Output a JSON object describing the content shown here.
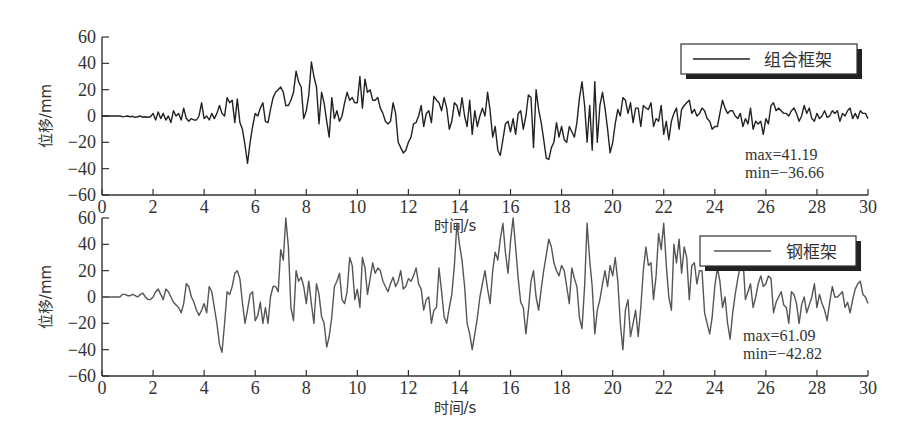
{
  "chart_data": [
    {
      "type": "line",
      "title": "",
      "legend": [
        "组合框架"
      ],
      "xlabel": "时间/s",
      "ylabel": "位移/mm",
      "xlim": [
        0,
        30
      ],
      "ylim": [
        -60,
        60
      ],
      "xticks": [
        0,
        2,
        4,
        6,
        8,
        10,
        12,
        14,
        16,
        18,
        20,
        22,
        24,
        26,
        28,
        30
      ],
      "yticks": [
        60,
        40,
        20,
        0,
        -20,
        -40,
        -60
      ],
      "grid": false,
      "legend_position": "upper right",
      "annotations": [
        "max=41.19",
        "min=−36.66"
      ],
      "line_color": "#222222",
      "series": [
        {
          "name": "组合框架",
          "x_step": 0.1,
          "values": [
            0,
            0,
            0,
            0,
            0,
            0,
            0,
            0,
            -0.5,
            -0.3,
            0,
            -0.5,
            -0.2,
            -1,
            -0.5,
            0,
            -1,
            -0.5,
            -1,
            -0.5,
            2,
            -3,
            3,
            -2,
            2,
            -3,
            0,
            -5,
            4,
            0,
            2,
            -3,
            6,
            -2,
            -4,
            -2,
            -3,
            -3,
            0,
            10,
            -2,
            0,
            -3,
            2,
            -2,
            2,
            8,
            2,
            0,
            14,
            10,
            12,
            -5,
            13,
            -5,
            -10,
            -22,
            -36,
            -20,
            -8,
            2,
            0,
            6,
            10,
            -4,
            -5,
            5,
            14,
            18,
            20,
            22,
            18,
            8,
            8,
            12,
            18,
            34,
            26,
            22,
            -2,
            4,
            16,
            41,
            30,
            22,
            -6,
            18,
            10,
            -4,
            -16,
            14,
            -2,
            4,
            -4,
            0,
            10,
            18,
            12,
            14,
            10,
            10,
            30,
            6,
            28,
            18,
            20,
            12,
            12,
            14,
            6,
            2,
            -4,
            -6,
            -4,
            10,
            2,
            -20,
            -24,
            -28,
            -26,
            -20,
            -16,
            -6,
            -5,
            0,
            8,
            -8,
            2,
            4,
            -5,
            15,
            12,
            10,
            4,
            14,
            6,
            -10,
            -4,
            10,
            8,
            0,
            14,
            0,
            -8,
            12,
            -14,
            4,
            -8,
            0,
            6,
            0,
            18,
            4,
            -16,
            -8,
            -26,
            -30,
            -18,
            -6,
            -4,
            -12,
            -2,
            -14,
            2,
            4,
            -10,
            0,
            16,
            14,
            -24,
            20,
            5,
            -5,
            -18,
            -32,
            -33,
            -24,
            -20,
            -5,
            -16,
            -8,
            -18,
            -20,
            -8,
            -12,
            -16,
            -5,
            14,
            26,
            8,
            -20,
            8,
            -26,
            26,
            -20,
            8,
            18,
            6,
            -10,
            -28,
            -20,
            -6,
            5,
            0,
            14,
            12,
            2,
            10,
            -5,
            6,
            6,
            -8,
            8,
            6,
            5,
            10,
            -8,
            -2,
            -4,
            8,
            -14,
            -4,
            -18,
            -4,
            2,
            6,
            -10,
            5,
            8,
            10,
            12,
            2,
            5,
            0,
            2,
            6,
            4,
            -2,
            -4,
            -10,
            -8,
            -8,
            2,
            12,
            6,
            2,
            4,
            4,
            0,
            -2,
            2,
            -8,
            -2,
            -6,
            6,
            -10,
            -4,
            -6,
            -4,
            -14,
            -2,
            -6,
            8,
            10,
            4,
            6,
            4,
            2,
            2,
            0,
            4,
            6,
            2,
            -4,
            0,
            8,
            2,
            6,
            -2,
            -4,
            2,
            -2,
            0,
            4,
            -1,
            0,
            4,
            2,
            4,
            -4,
            2,
            0,
            4,
            6,
            -2,
            2,
            -2,
            4,
            2,
            2,
            -2,
            0,
            3,
            2,
            0,
            4,
            -2,
            2,
            0,
            4,
            2,
            6,
            2,
            0,
            -4,
            0,
            6,
            2,
            0,
            -2,
            2,
            4,
            -2,
            2,
            0,
            2,
            -1,
            0,
            3,
            0,
            -2,
            -2,
            0,
            2,
            0,
            2,
            4,
            2,
            0,
            2,
            0,
            0,
            2,
            -2,
            2,
            2,
            -2,
            0,
            0,
            2,
            2,
            0,
            -2,
            -1,
            0,
            2,
            6,
            2,
            0,
            1,
            0,
            -1,
            -1,
            0,
            0,
            4,
            2,
            0,
            -2,
            -1,
            0,
            1,
            0,
            -1,
            0,
            1,
            2,
            0,
            0,
            2,
            0,
            0,
            1,
            2,
            0,
            2,
            1,
            2,
            0,
            2,
            2,
            2,
            2,
            3
          ]
        }
      ]
    },
    {
      "type": "line",
      "title": "",
      "legend": [
        "钢框架"
      ],
      "xlabel": "时间/s",
      "ylabel": "位移/mm",
      "xlim": [
        0,
        30
      ],
      "ylim": [
        -60,
        60
      ],
      "xticks": [
        0,
        2,
        4,
        6,
        8,
        10,
        12,
        14,
        16,
        18,
        20,
        22,
        24,
        26,
        28,
        30
      ],
      "yticks": [
        60,
        40,
        20,
        0,
        -20,
        -40,
        -60
      ],
      "grid": false,
      "legend_position": "upper right",
      "annotations": [
        "max=61.09",
        "min=−42.82"
      ],
      "line_color": "#555555",
      "series": [
        {
          "name": "钢框架",
          "x_step": 0.1,
          "values": [
            0,
            0,
            0,
            0,
            0,
            0,
            0,
            0,
            2,
            2,
            1,
            1,
            2,
            1,
            0,
            2,
            3,
            0,
            -2,
            -2,
            0,
            4,
            6,
            2,
            -2,
            6,
            4,
            0,
            -4,
            -6,
            -8,
            -12,
            -5,
            10,
            8,
            0,
            -4,
            -10,
            -14,
            -10,
            -5,
            -12,
            8,
            4,
            -8,
            -20,
            -36,
            -42,
            -20,
            4,
            2,
            8,
            18,
            20,
            14,
            -4,
            -20,
            -10,
            2,
            4,
            -18,
            -14,
            -4,
            -20,
            -8,
            -20,
            0,
            8,
            8,
            4,
            36,
            28,
            60,
            38,
            -8,
            -18,
            20,
            12,
            15,
            8,
            -5,
            12,
            -5,
            -20,
            10,
            2,
            -15,
            -20,
            -38,
            -30,
            -15,
            8,
            12,
            18,
            -2,
            -5,
            4,
            30,
            24,
            -2,
            6,
            -8,
            30,
            22,
            2,
            14,
            26,
            18,
            22,
            20,
            12,
            8,
            4,
            10,
            15,
            8,
            12,
            20,
            6,
            8,
            14,
            12,
            16,
            22,
            10,
            6,
            -10,
            -2,
            0,
            -20,
            -10,
            -8,
            22,
            4,
            -15,
            -20,
            -8,
            2,
            24,
            56,
            40,
            28,
            8,
            -20,
            -28,
            -40,
            -28,
            -16,
            0,
            10,
            20,
            6,
            -5,
            20,
            34,
            28,
            44,
            56,
            34,
            18,
            42,
            60,
            38,
            14,
            -4,
            -8,
            -28,
            -10,
            12,
            20,
            0,
            -10,
            6,
            20,
            32,
            44,
            38,
            26,
            20,
            16,
            24,
            20,
            8,
            -5,
            22,
            14,
            8,
            -16,
            -24,
            8,
            56,
            28,
            8,
            -28,
            -10,
            -2,
            10,
            20,
            8,
            24,
            16,
            30,
            12,
            -20,
            -40,
            -10,
            -2,
            -30,
            -20,
            -10,
            -30,
            -8,
            20,
            38,
            24,
            26,
            -2,
            16,
            48,
            36,
            56,
            24,
            0,
            -10,
            40,
            26,
            44,
            18,
            38,
            30,
            -2,
            24,
            26,
            10,
            20,
            20,
            -12,
            -20,
            -28,
            -15,
            8,
            22,
            12,
            -8,
            0,
            -20,
            -32,
            -12,
            2,
            14,
            24,
            30,
            -2,
            4,
            10,
            -8,
            0,
            10,
            16,
            8,
            10,
            16,
            14,
            -12,
            -4,
            0,
            4,
            -6,
            -8,
            -20,
            4,
            2,
            -5,
            -20,
            -6,
            0,
            -12,
            -6,
            0,
            10,
            -8,
            2,
            -5,
            -10,
            -18,
            -4,
            8,
            0,
            0,
            2,
            4,
            -8,
            -4,
            -12,
            -2,
            6,
            10,
            12,
            2,
            0,
            -5,
            6,
            4,
            -8,
            8,
            -4,
            4,
            10,
            4,
            2,
            10,
            8,
            6,
            0,
            8,
            2,
            4,
            4,
            0,
            -6,
            -4,
            -6,
            -4,
            -2,
            0,
            0,
            2,
            2,
            4,
            0,
            6,
            2,
            4,
            0,
            3,
            4,
            2,
            0,
            2,
            -2,
            2,
            0,
            4,
            2,
            0,
            2,
            0,
            -2,
            2,
            6,
            2,
            3,
            4,
            0,
            2,
            2,
            4,
            0,
            0,
            0,
            2,
            0,
            -2,
            2,
            -1,
            0,
            2,
            0,
            2,
            -1,
            0,
            2,
            1,
            0,
            2,
            0,
            1,
            -1,
            0,
            2,
            -1,
            0,
            2,
            4,
            2,
            2,
            2
          ]
        }
      ]
    }
  ],
  "panels": [
    {
      "legend_label": "组合框架",
      "max_text": "max=41.19",
      "min_text": "min=−36.66",
      "xlabel": "时间/s",
      "ylabel": "位移/mm"
    },
    {
      "legend_label": "钢框架",
      "max_text": "max=61.09",
      "min_text": "min=−42.82",
      "xlabel": "时间/s",
      "ylabel": "位移/mm"
    }
  ],
  "tick_labels": {
    "x": [
      "0",
      "2",
      "4",
      "6",
      "8",
      "10",
      "12",
      "14",
      "16",
      "18",
      "20",
      "22",
      "24",
      "26",
      "28",
      "30"
    ],
    "y": [
      "60",
      "40",
      "20",
      "0",
      "−20",
      "−40",
      "−60"
    ]
  }
}
